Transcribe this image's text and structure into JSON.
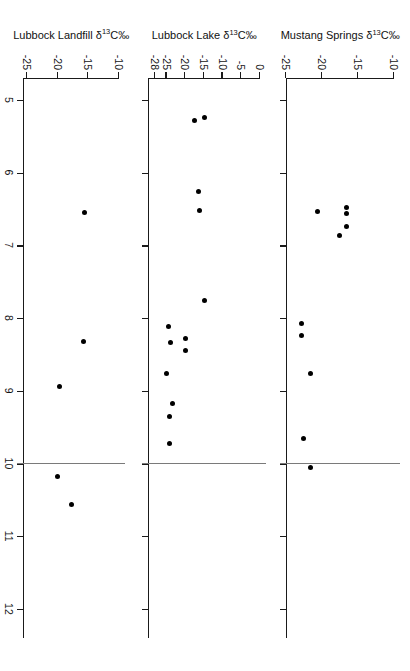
{
  "figure": {
    "orientation": "rotated-90-clockwise",
    "xaxis": {
      "label_prefix": "",
      "label_sup": "14",
      "label_main": "C age (10",
      "label_sup2": "3",
      "label_tail": " yr B.P.)",
      "label_full": "14C age (10^3 yr B.P.)",
      "ticks": [
        "5",
        "6",
        "7",
        "8",
        "9",
        "10",
        "11",
        "12"
      ],
      "range": [
        4.7,
        12.4
      ],
      "reference_line": 10
    },
    "panels": [
      {
        "id": "mustang-springs",
        "title_main": "Mustang Springs ",
        "title_delta": "δ",
        "title_sup": "13",
        "title_tail": "C‰",
        "title_full": "Mustang Springs δ13C‰",
        "yticks": [
          "-10",
          "-15",
          "-20",
          "-25"
        ],
        "ytick_values": [
          -10,
          -15,
          -20,
          -25
        ],
        "ylim": [
          -25,
          -10
        ]
      },
      {
        "id": "lubbock-lake",
        "title_main": "Lubbock Lake ",
        "title_delta": "δ",
        "title_sup": "13",
        "title_tail": "C‰",
        "title_full": "Lubbock Lake δ13C‰",
        "yticks": [
          "0",
          "-5",
          "-10",
          "-15",
          "-20",
          "-25",
          "-28"
        ],
        "ytick_values": [
          0,
          -5,
          -10,
          -15,
          -20,
          -25,
          -28
        ],
        "ylim": [
          -30,
          0
        ]
      },
      {
        "id": "lubbock-landfill",
        "title_main": "Lubbock Landfill ",
        "title_delta": "δ",
        "title_sup": "13",
        "title_tail": "C‰",
        "title_full": "Lubbock Landfill δ13C‰",
        "yticks": [
          "-10",
          "-15",
          "-20",
          "-25"
        ],
        "ytick_values": [
          -10,
          -15,
          -20,
          -25
        ],
        "ylim": [
          -25.7,
          -10
        ]
      }
    ]
  },
  "chart_data": [
    {
      "type": "scatter",
      "title": "Mustang Springs δ13C‰",
      "xlabel": "14C age (10^3 yr B.P.)",
      "ylabel": "Mustang Springs δ13C‰",
      "xlim": [
        4.7,
        12.4
      ],
      "ylim": [
        -25,
        -10
      ],
      "grid": false,
      "legend": "none",
      "reference_line_x": 10,
      "points": [
        {
          "x": 6.48,
          "y": -16.6
        },
        {
          "x": 6.56,
          "y": -16.6
        },
        {
          "x": 6.74,
          "y": -16.6
        },
        {
          "x": 6.86,
          "y": -17.6
        },
        {
          "x": 6.54,
          "y": -20.6
        },
        {
          "x": 8.08,
          "y": -22.9
        },
        {
          "x": 8.24,
          "y": -22.9
        },
        {
          "x": 8.76,
          "y": -21.6
        },
        {
          "x": 9.66,
          "y": -22.5
        },
        {
          "x": 10.06,
          "y": -21.6
        }
      ]
    },
    {
      "type": "scatter",
      "title": "Lubbock Lake δ13C‰",
      "xlabel": "14C age (10^3 yr B.P.)",
      "ylabel": "Lubbock Lake δ13C‰",
      "xlim": [
        4.7,
        12.4
      ],
      "ylim": [
        -30,
        0
      ],
      "grid": false,
      "legend": "none",
      "reference_line_x": 10,
      "points": [
        {
          "x": 5.24,
          "y": -14.8
        },
        {
          "x": 5.28,
          "y": -17.5
        },
        {
          "x": 6.26,
          "y": -16.4
        },
        {
          "x": 6.52,
          "y": -16.1
        },
        {
          "x": 7.76,
          "y": -14.8
        },
        {
          "x": 8.28,
          "y": -19.9
        },
        {
          "x": 8.44,
          "y": -19.9
        },
        {
          "x": 8.12,
          "y": -24.5
        },
        {
          "x": 8.34,
          "y": -23.9
        },
        {
          "x": 8.76,
          "y": -25.1
        },
        {
          "x": 9.18,
          "y": -23.5
        },
        {
          "x": 9.36,
          "y": -24.2
        },
        {
          "x": 9.72,
          "y": -24.3
        }
      ]
    },
    {
      "type": "scatter",
      "title": "Lubbock Landfill δ13C‰",
      "xlabel": "14C age (10^3 yr B.P.)",
      "ylabel": "Lubbock Landfill δ13C‰",
      "xlim": [
        4.7,
        12.4
      ],
      "ylim": [
        -25.7,
        -10
      ],
      "grid": false,
      "legend": "none",
      "reference_line_x": 10,
      "points": [
        {
          "x": 6.55,
          "y": -15.7
        },
        {
          "x": 8.32,
          "y": -15.8
        },
        {
          "x": 8.94,
          "y": -19.8
        },
        {
          "x": 10.18,
          "y": -20.0
        },
        {
          "x": 10.56,
          "y": -17.7
        }
      ]
    }
  ]
}
